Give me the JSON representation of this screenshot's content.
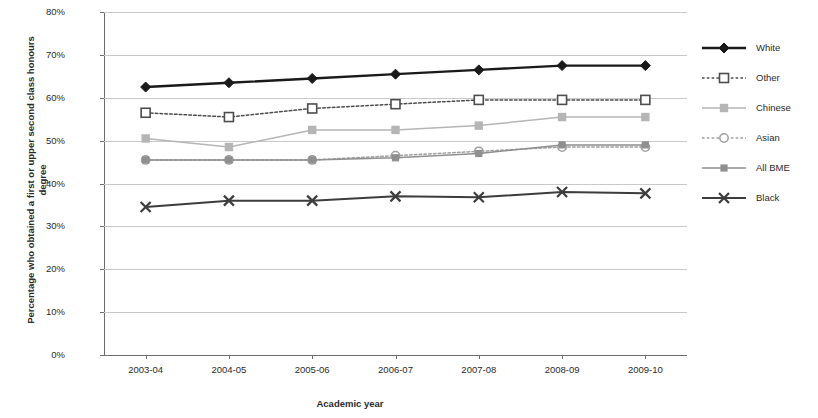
{
  "chart_data": {
    "type": "line",
    "title": "",
    "xlabel": "Academic year",
    "ylabel": "Percentage who obtained a first or upper second class honours degree",
    "categories": [
      "2003-04",
      "2004-05",
      "2005-06",
      "2006-07",
      "2007-08",
      "2008-09",
      "2009-10"
    ],
    "ylim": [
      0,
      80
    ],
    "ytick_labels": [
      "0%",
      "10%",
      "20%",
      "30%",
      "40%",
      "50%",
      "60%",
      "70%",
      "80%"
    ],
    "ytick_values": [
      0,
      10,
      20,
      30,
      40,
      50,
      60,
      70,
      80
    ],
    "grid": true,
    "legend_position": "right",
    "series": [
      {
        "name": "White",
        "marker": "diamond",
        "line_style": "solid",
        "color": "#1a1a1a",
        "values": [
          62.5,
          63.5,
          64.5,
          65.5,
          66.5,
          67.5,
          67.5
        ]
      },
      {
        "name": "Other",
        "marker": "square-open",
        "line_style": "dotted",
        "color": "#4d4d4d",
        "values": [
          56.5,
          55.5,
          57.5,
          58.5,
          59.5,
          59.5,
          59.5
        ]
      },
      {
        "name": "Chinese",
        "marker": "square-filled",
        "line_style": "solid",
        "color": "#b5b5b5",
        "values": [
          50.5,
          48.5,
          52.5,
          52.5,
          53.5,
          55.5,
          55.5
        ]
      },
      {
        "name": "Asian",
        "marker": "circle-open",
        "line_style": "dotted",
        "color": "#a0a0a0",
        "values": [
          45.5,
          45.5,
          45.5,
          46.5,
          47.5,
          48.5,
          48.5
        ]
      },
      {
        "name": "All BME",
        "marker": "square-small",
        "line_style": "solid",
        "color": "#8f8f8f",
        "values": [
          45.5,
          45.5,
          45.5,
          46.0,
          47.0,
          49.0,
          49.0
        ]
      },
      {
        "name": "Black",
        "marker": "cross",
        "line_style": "solid",
        "color": "#3d3d3d",
        "values": [
          34.5,
          36.0,
          36.0,
          37.0,
          36.8,
          38.0,
          37.7
        ]
      }
    ]
  }
}
